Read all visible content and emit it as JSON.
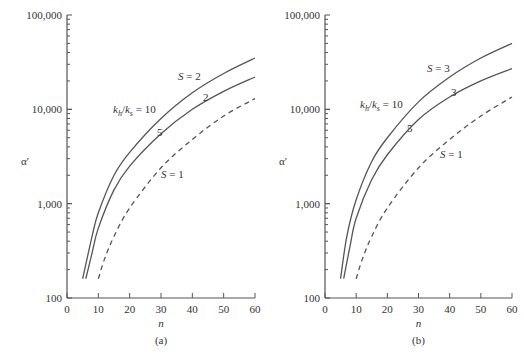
{
  "chart_data": [
    {
      "type": "line",
      "panel_label": "(a)",
      "xlabel": "n",
      "ylabel": "α′",
      "yscale": "log",
      "xlim": [
        0,
        60
      ],
      "ylim": [
        100,
        100000
      ],
      "x_ticks": [
        "0",
        "10",
        "20",
        "30",
        "40",
        "50",
        "60"
      ],
      "y_ticks": [
        "100",
        "1,000",
        "10,000",
        "100,000"
      ],
      "grid": false,
      "series": [
        {
          "name": "kh/ks = 10, S = 2",
          "style": "solid",
          "x": [
            5,
            8,
            10,
            15,
            20,
            30,
            40,
            50,
            60
          ],
          "y": [
            160,
            450,
            800,
            2000,
            3500,
            8000,
            15000,
            24000,
            35000
          ]
        },
        {
          "name": "kh/ks = 5, S = 2",
          "style": "solid",
          "x": [
            6,
            8,
            10,
            15,
            20,
            30,
            40,
            50,
            60
          ],
          "y": [
            160,
            300,
            550,
            1400,
            2500,
            5500,
            10000,
            15500,
            22000
          ]
        },
        {
          "name": "S = 1",
          "style": "dashed",
          "x": [
            10,
            12,
            15,
            20,
            30,
            40,
            50,
            60
          ],
          "y": [
            160,
            260,
            450,
            900,
            2400,
            4800,
            8500,
            13000
          ]
        }
      ],
      "annotations": [
        "S = 2",
        "k_h/k_s = 10",
        "5",
        "2",
        "S = 1"
      ]
    },
    {
      "type": "line",
      "panel_label": "(b)",
      "xlabel": "n",
      "ylabel": "α′",
      "yscale": "log",
      "xlim": [
        0,
        60
      ],
      "ylim": [
        100,
        100000
      ],
      "x_ticks": [
        "0",
        "10",
        "20",
        "30",
        "40",
        "50",
        "60"
      ],
      "y_ticks": [
        "100",
        "1,000",
        "10,000",
        "100,000"
      ],
      "grid": false,
      "series": [
        {
          "name": "kh/ks = 10, S = 3",
          "style": "solid",
          "x": [
            5,
            7,
            10,
            15,
            20,
            30,
            40,
            50,
            60
          ],
          "y": [
            160,
            450,
            1100,
            2800,
            5000,
            12000,
            22000,
            35000,
            50000
          ]
        },
        {
          "name": "kh/ks = 5, S = 3",
          "style": "solid",
          "x": [
            6,
            8,
            10,
            15,
            20,
            30,
            40,
            50,
            60
          ],
          "y": [
            160,
            350,
            700,
            1800,
            3300,
            7800,
            13500,
            20000,
            27000
          ]
        },
        {
          "name": "S = 1",
          "style": "dashed",
          "x": [
            10,
            12,
            15,
            20,
            30,
            40,
            50,
            60
          ],
          "y": [
            160,
            260,
            450,
            900,
            2400,
            4800,
            8500,
            13500
          ]
        }
      ],
      "annotations": [
        "S = 3",
        "k_h/k_s = 10",
        "5",
        "3",
        "S = 1"
      ]
    }
  ],
  "panels": [
    {
      "label": "(a)",
      "xlabel": "n",
      "ylabel": "α′",
      "ann_top": "S = 2",
      "ann_ratio": "10",
      "ann_five": "5",
      "ann_mid": "2",
      "ann_s1": "S = 1"
    },
    {
      "label": "(b)",
      "xlabel": "n",
      "ylabel": "α′",
      "ann_top": "S = 3",
      "ann_ratio": "10",
      "ann_five": "5",
      "ann_mid": "3",
      "ann_s1": "S = 1"
    }
  ]
}
